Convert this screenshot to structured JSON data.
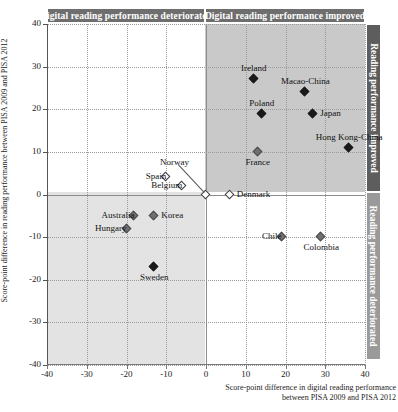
{
  "header": {
    "left_band": "Digital reading performance deteriorated",
    "right_band": "Digital reading performance improved"
  },
  "side": {
    "top_band": "Reading performance improved",
    "bottom_band": "Reading performance deteriorated"
  },
  "chart_data": {
    "type": "scatter",
    "title": "",
    "xlabel": "Score-point difference in digital reading performance between PISA 2009 and PISA 2012",
    "xlabel_line1": "Score-point difference in digital reading performance",
    "xlabel_line2": "between PISA 2009 and PISA 2012",
    "ylabel": "Score-point difference in reading performance between PISA 2009 and PISA 2012",
    "xlim": [
      -40,
      40
    ],
    "ylim": [
      -40,
      40
    ],
    "xticks": [
      -40,
      -30,
      -20,
      -10,
      0,
      10,
      20,
      30,
      40
    ],
    "ytick_labels": [
      "40",
      "30",
      "20",
      "10",
      "0",
      "-10",
      "-20",
      "-30",
      "-40"
    ],
    "yticks": [
      40,
      30,
      20,
      10,
      0,
      -10,
      -20,
      -30,
      -40
    ],
    "grid": true,
    "legend": "none",
    "points": [
      {
        "name": "Ireland",
        "x": 12,
        "y": 27,
        "style": "filled",
        "label_pos": "above"
      },
      {
        "name": "Macao-China",
        "x": 25,
        "y": 24,
        "style": "filled",
        "label_pos": "above"
      },
      {
        "name": "Poland",
        "x": 14,
        "y": 19,
        "style": "filled",
        "label_pos": "above"
      },
      {
        "name": "Japan",
        "x": 27,
        "y": 19,
        "style": "filled",
        "label_pos": "right"
      },
      {
        "name": "Hong Kong-China",
        "x": 36,
        "y": 11,
        "style": "filled",
        "label_pos": "above"
      },
      {
        "name": "France",
        "x": 13,
        "y": 10,
        "style": "gray",
        "label_pos": "below"
      },
      {
        "name": "Spain",
        "x": -10,
        "y": 4,
        "style": "open",
        "label_pos": "left"
      },
      {
        "name": "Belgium",
        "x": -6,
        "y": 2,
        "style": "open",
        "label_pos": "left"
      },
      {
        "name": "Norway",
        "x": 0,
        "y": 0,
        "style": "open",
        "label_pos": "leader"
      },
      {
        "name": "Denmark",
        "x": 6,
        "y": 0,
        "style": "open",
        "label_pos": "right"
      },
      {
        "name": "Australia",
        "x": -18,
        "y": -5,
        "style": "gray",
        "label_pos": "left"
      },
      {
        "name": "Korea",
        "x": -13,
        "y": -5,
        "style": "gray",
        "label_pos": "right"
      },
      {
        "name": "Hungary",
        "x": -20,
        "y": -8,
        "style": "gray",
        "label_pos": "left"
      },
      {
        "name": "Sweden",
        "x": -13,
        "y": -17,
        "style": "filled",
        "label_pos": "below"
      },
      {
        "name": "Chile",
        "x": 19,
        "y": -10,
        "style": "gray",
        "label_pos": "left"
      },
      {
        "name": "Colombia",
        "x": 29,
        "y": -10,
        "style": "gray",
        "label_pos": "below"
      }
    ]
  },
  "colors": {
    "band_dark": "#6e6e6e",
    "band_mid": "#5d5d5d",
    "band_light": "#9a9a9a",
    "quadrant_upper_right": "#c9c9c9",
    "quadrant_lower_left": "#e3e3e3",
    "marker_filled": "#1a1a1a",
    "marker_gray": "#707070",
    "marker_open": "#ffffff"
  }
}
